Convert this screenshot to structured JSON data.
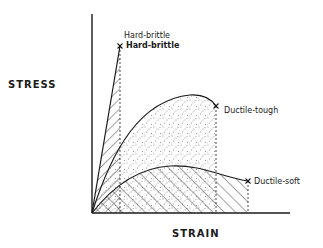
{
  "diagram": {
    "type": "stress-strain",
    "axes": {
      "y_label": "STRESS",
      "x_label": "STRAIN"
    },
    "curves": [
      {
        "name": "Hard-brittle",
        "label": "Hard-brittle",
        "fill": "hatched",
        "end_marker": "x"
      },
      {
        "name": "Ductile-tough",
        "label": "Ductile-tough",
        "fill": "stippled",
        "end_marker": "x"
      },
      {
        "name": "Ductile-soft",
        "label": "Ductile-soft",
        "fill": "hatched",
        "end_marker": "x"
      }
    ],
    "extra_labels": [
      "Hard-brittle"
    ],
    "colors": {
      "ink": "#1a1a1a",
      "background": "#ffffff"
    }
  }
}
